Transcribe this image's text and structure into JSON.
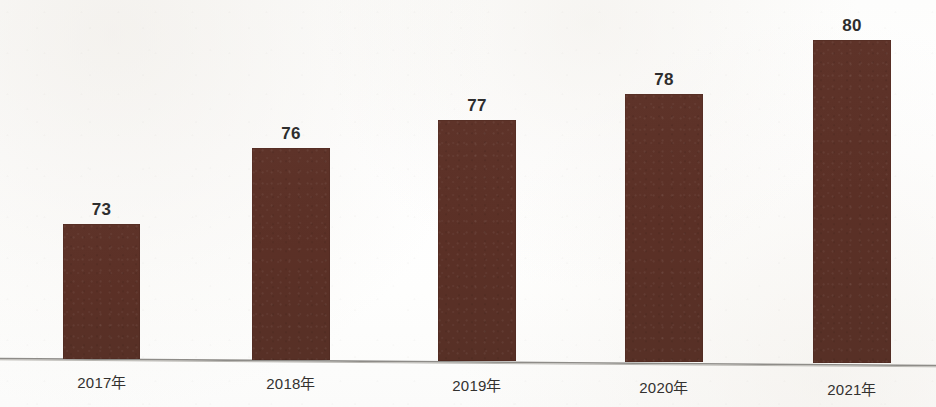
{
  "chart_data": {
    "type": "bar",
    "title": "",
    "subtitle": "",
    "xlabel": "",
    "ylabel": "",
    "categories": [
      "2017年",
      "2018年",
      "2019年",
      "2020年",
      "2021年"
    ],
    "values": [
      73,
      76,
      77,
      78,
      80
    ],
    "value_labels": [
      "73",
      "76",
      "77",
      "78",
      "80"
    ],
    "ylim": [
      0,
      86
    ],
    "grid": false,
    "legend": false,
    "legend_position": "none",
    "axis_visible": {
      "x_axis_line": true,
      "y_axis_line": false,
      "x_ticks": false,
      "y_ticks": false
    },
    "series": [
      {
        "name": "",
        "values": [
          73,
          76,
          77,
          78,
          80
        ]
      }
    ],
    "colors": {
      "bar": "#5c3127",
      "value_label": "#2e2e2e",
      "category_label": "#33312f",
      "axis_line": "#8e8c88",
      "background": "#ffffff"
    }
  },
  "geometry": {
    "bars": [
      {
        "left": 63,
        "width": 77,
        "top": 224,
        "bottom": 359
      },
      {
        "left": 252,
        "width": 78,
        "top": 148,
        "bottom": 360
      },
      {
        "left": 438,
        "width": 78,
        "top": 120,
        "bottom": 361
      },
      {
        "left": 625,
        "width": 78,
        "top": 94,
        "bottom": 362
      },
      {
        "left": 813,
        "width": 78,
        "top": 40,
        "bottom": 363
      }
    ],
    "value_label_y": [
      196,
      120,
      92,
      66,
      12
    ],
    "category_label_x": [
      63,
      252,
      438,
      625,
      813
    ],
    "category_label_width": [
      78,
      78,
      78,
      78,
      78
    ]
  }
}
